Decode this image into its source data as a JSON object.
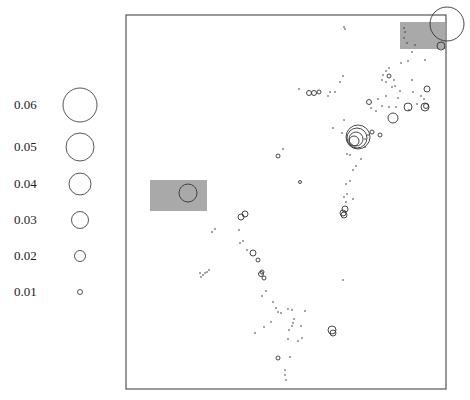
{
  "chart_data": {
    "type": "scatter",
    "subtype": "proportional-symbol map",
    "title": "",
    "xlabel": "",
    "ylabel": "",
    "frame": {
      "x0": 126,
      "y0": 15,
      "x1": 446,
      "y1": 389
    },
    "legend": {
      "position": "left",
      "entries": [
        {
          "label": "0.06",
          "value": 0.06,
          "y": 105,
          "r": 17
        },
        {
          "label": "0.05",
          "value": 0.05,
          "y": 147,
          "r": 14
        },
        {
          "label": "0.04",
          "value": 0.04,
          "y": 184,
          "r": 11
        },
        {
          "label": "0.03",
          "value": 0.03,
          "y": 220,
          "r": 8.5
        },
        {
          "label": "0.02",
          "value": 0.02,
          "y": 256,
          "r": 5.5
        },
        {
          "label": "0.01",
          "value": 0.01,
          "y": 292,
          "r": 2.5
        }
      ],
      "circle_cx": 80
    },
    "highlight_boxes": [
      {
        "x": 400,
        "y": 22,
        "w": 45,
        "h": 27,
        "color": "#a9a9a9"
      },
      {
        "x": 150,
        "y": 180,
        "w": 57,
        "h": 31,
        "color": "#a9a9a9"
      }
    ],
    "circles": [
      {
        "x": 447,
        "y": 24,
        "r": 17
      },
      {
        "x": 441,
        "y": 46,
        "r": 4
      },
      {
        "x": 188,
        "y": 193,
        "r": 9
      },
      {
        "x": 357,
        "y": 138,
        "r": 10
      },
      {
        "x": 356,
        "y": 139,
        "r": 7
      },
      {
        "x": 354,
        "y": 141,
        "r": 5
      },
      {
        "x": 358,
        "y": 137,
        "r": 12
      },
      {
        "x": 393,
        "y": 118,
        "r": 5
      },
      {
        "x": 408,
        "y": 107,
        "r": 4
      },
      {
        "x": 425,
        "y": 107,
        "r": 4
      },
      {
        "x": 426,
        "y": 106,
        "r": 2.5
      },
      {
        "x": 427,
        "y": 89,
        "r": 3
      },
      {
        "x": 372,
        "y": 132,
        "r": 2
      },
      {
        "x": 380,
        "y": 135,
        "r": 2
      },
      {
        "x": 309,
        "y": 93,
        "r": 2.5
      },
      {
        "x": 314,
        "y": 93,
        "r": 2.5
      },
      {
        "x": 319,
        "y": 92,
        "r": 2
      },
      {
        "x": 369,
        "y": 102,
        "r": 2.5
      },
      {
        "x": 389,
        "y": 76,
        "r": 2
      },
      {
        "x": 278,
        "y": 156,
        "r": 2
      },
      {
        "x": 300,
        "y": 182,
        "r": 1.5
      },
      {
        "x": 345,
        "y": 209,
        "r": 3
      },
      {
        "x": 343,
        "y": 213,
        "r": 3
      },
      {
        "x": 344,
        "y": 215,
        "r": 3
      },
      {
        "x": 241,
        "y": 217,
        "r": 3
      },
      {
        "x": 245,
        "y": 214,
        "r": 3
      },
      {
        "x": 253,
        "y": 253,
        "r": 3
      },
      {
        "x": 258,
        "y": 260,
        "r": 2
      },
      {
        "x": 262,
        "y": 272,
        "r": 2
      },
      {
        "x": 261,
        "y": 274,
        "r": 2.5
      },
      {
        "x": 264,
        "y": 278,
        "r": 2
      },
      {
        "x": 332,
        "y": 330,
        "r": 4
      },
      {
        "x": 333,
        "y": 333,
        "r": 3
      },
      {
        "x": 278,
        "y": 358,
        "r": 2
      }
    ],
    "dots": [
      [
        344,
        27
      ],
      [
        345,
        29
      ],
      [
        404,
        28
      ],
      [
        405,
        32
      ],
      [
        404,
        38
      ],
      [
        407,
        43
      ],
      [
        415,
        45
      ],
      [
        412,
        52
      ],
      [
        425,
        60
      ],
      [
        408,
        61
      ],
      [
        401,
        63
      ],
      [
        389,
        68
      ],
      [
        386,
        71
      ],
      [
        383,
        75
      ],
      [
        382,
        80
      ],
      [
        386,
        82
      ],
      [
        386,
        96
      ],
      [
        398,
        98
      ],
      [
        400,
        91
      ],
      [
        413,
        92
      ],
      [
        412,
        80
      ],
      [
        394,
        80
      ],
      [
        395,
        86
      ],
      [
        392,
        87
      ],
      [
        330,
        92
      ],
      [
        335,
        92
      ],
      [
        328,
        96
      ],
      [
        299,
        89
      ],
      [
        340,
        82
      ],
      [
        343,
        76
      ],
      [
        344,
        120
      ],
      [
        342,
        133
      ],
      [
        333,
        128
      ],
      [
        368,
        135
      ],
      [
        365,
        139
      ],
      [
        365,
        147
      ],
      [
        361,
        159
      ],
      [
        356,
        166
      ],
      [
        353,
        170
      ],
      [
        350,
        181
      ],
      [
        346,
        184
      ],
      [
        347,
        194
      ],
      [
        344,
        197
      ],
      [
        346,
        202
      ],
      [
        353,
        199
      ],
      [
        347,
        154
      ],
      [
        350,
        155
      ],
      [
        283,
        149
      ],
      [
        378,
        99
      ],
      [
        371,
        108
      ],
      [
        376,
        111
      ],
      [
        382,
        106
      ],
      [
        389,
        107
      ],
      [
        396,
        107
      ],
      [
        409,
        110
      ],
      [
        417,
        104
      ],
      [
        424,
        99
      ],
      [
        421,
        96
      ],
      [
        215,
        229
      ],
      [
        212,
        232
      ],
      [
        239,
        230
      ],
      [
        240,
        243
      ],
      [
        243,
        241
      ],
      [
        247,
        250
      ],
      [
        209,
        270
      ],
      [
        207,
        272
      ],
      [
        205,
        273
      ],
      [
        200,
        273
      ],
      [
        203,
        275
      ],
      [
        201,
        277
      ],
      [
        266,
        291
      ],
      [
        262,
        296
      ],
      [
        273,
        302
      ],
      [
        276,
        308
      ],
      [
        278,
        312
      ],
      [
        281,
        313
      ],
      [
        288,
        309
      ],
      [
        292,
        310
      ],
      [
        305,
        311
      ],
      [
        294,
        319
      ],
      [
        293,
        323
      ],
      [
        301,
        326
      ],
      [
        292,
        326
      ],
      [
        289,
        330
      ],
      [
        288,
        339
      ],
      [
        298,
        341
      ],
      [
        302,
        338
      ],
      [
        264,
        327
      ],
      [
        271,
        322
      ],
      [
        255,
        333
      ],
      [
        290,
        357
      ],
      [
        285,
        370
      ],
      [
        285,
        375
      ],
      [
        286,
        380
      ],
      [
        343,
        280
      ]
    ]
  },
  "legend_labels": [
    "0.06",
    "0.05",
    "0.04",
    "0.03",
    "0.02",
    "0.01"
  ]
}
